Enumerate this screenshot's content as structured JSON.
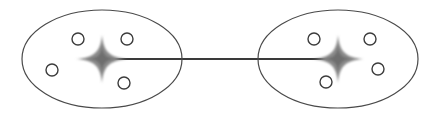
{
  "figure": {
    "width": 434,
    "height": 118,
    "background_color": "#ffffff"
  },
  "style": {
    "ellipse_stroke_color": "#4a4a4a",
    "ellipse_stroke_width": 1.2,
    "circle_stroke_color": "#3c3c3c",
    "circle_stroke_width": 1.4,
    "circle_radius": 6,
    "link_color": "#3a3a3a",
    "link_width": 1.2,
    "star_color": "#8a8a8a",
    "star_core_color": "#6e6e6e",
    "star_blur": 1.1
  },
  "chart_data": {
    "type": "scatter",
    "title": "",
    "xlabel": "",
    "ylabel": "",
    "xlim": [
      0,
      434
    ],
    "ylim": [
      0,
      118
    ],
    "grid": false,
    "legend": false,
    "clusters": [
      {
        "name": "cluster-left",
        "ellipse": {
          "cx": 102,
          "cy": 59,
          "rx": 80,
          "ry": 49
        },
        "centroid": {
          "cx": 102,
          "cy": 59,
          "rx": 26,
          "ry": 24
        },
        "points": [
          {
            "cx": 78,
            "cy": 39
          },
          {
            "cx": 127,
            "cy": 39
          },
          {
            "cx": 52,
            "cy": 70
          },
          {
            "cx": 124,
            "cy": 83
          }
        ]
      },
      {
        "name": "cluster-right",
        "ellipse": {
          "cx": 338,
          "cy": 59,
          "rx": 80,
          "ry": 49
        },
        "centroid": {
          "cx": 338,
          "cy": 59,
          "rx": 26,
          "ry": 24
        },
        "points": [
          {
            "cx": 314,
            "cy": 39
          },
          {
            "cx": 370,
            "cy": 39
          },
          {
            "cx": 378,
            "cy": 69
          },
          {
            "cx": 326,
            "cy": 82
          }
        ]
      }
    ],
    "links": [
      {
        "name": "centroid-link",
        "x1": 102,
        "y1": 59,
        "x2": 338,
        "y2": 59
      }
    ]
  }
}
